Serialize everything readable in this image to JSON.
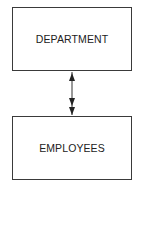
{
  "diagram": {
    "type": "entity-relationship",
    "entities": [
      {
        "id": "department",
        "label": "DEPARTMENT"
      },
      {
        "id": "employees",
        "label": "EMPLOYEES"
      }
    ],
    "relationships": [
      {
        "from": "department",
        "to": "employees",
        "cardinality": "one-to-many",
        "style": "single arrowhead at DEPARTMENT, double arrowhead at EMPLOYEES"
      }
    ]
  }
}
